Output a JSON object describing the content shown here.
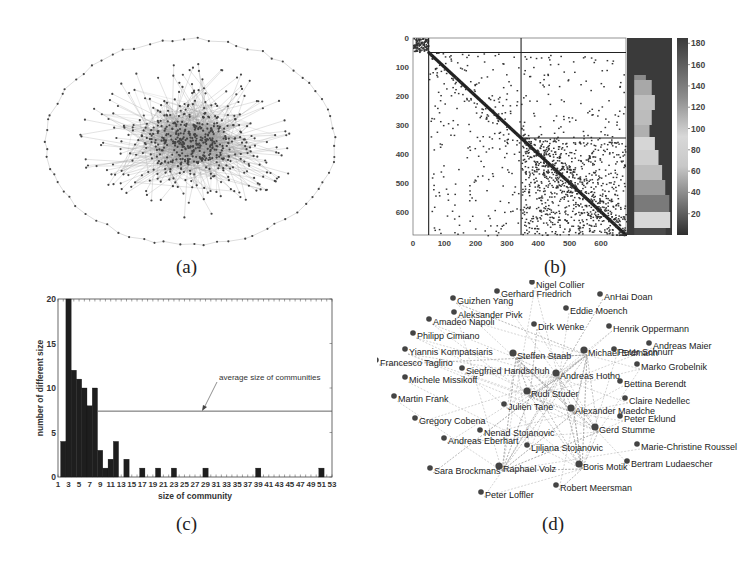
{
  "panels": {
    "a": {
      "caption": "(a)"
    },
    "b": {
      "caption": "(b)"
    },
    "c": {
      "caption": "(c)"
    },
    "d": {
      "caption": "(d)"
    }
  },
  "chart_data": [
    {
      "id": "a",
      "type": "network",
      "title": "",
      "description": "Large graph of a community network: dense central cluster with radiating edges, outer ring of isolated nodes arranged on an ellipse"
    },
    {
      "id": "b",
      "type": "heatmap",
      "title": "",
      "x_ticks": [
        "0",
        "100",
        "200",
        "300",
        "400",
        "500",
        "600"
      ],
      "y_ticks": [
        "0",
        "100",
        "200",
        "300",
        "400",
        "500",
        "600"
      ],
      "xlim": [
        0,
        680
      ],
      "ylim": [
        0,
        680
      ],
      "block_dividers": [
        50,
        345
      ],
      "colorbar": {
        "ticks": [
          "180",
          "160",
          "140",
          "120",
          "100",
          "80",
          "60",
          "40",
          "20"
        ],
        "range": [
          0,
          185
        ]
      },
      "description": "Adjacency matrix sorted by community with dense diagonal, divided into blocks at ~50 and ~345, side bar shows community membership"
    },
    {
      "id": "c",
      "type": "bar",
      "title": "",
      "xlabel": "size of community",
      "ylabel": "number of different size",
      "x_ticks": [
        "1",
        "3",
        "5",
        "7",
        "9",
        "11",
        "13",
        "15",
        "17",
        "19",
        "21",
        "23",
        "25",
        "27",
        "29",
        "31",
        "33",
        "35",
        "37",
        "39",
        "41",
        "43",
        "45",
        "47",
        "49",
        "51",
        "53"
      ],
      "y_ticks": [
        "0",
        "5",
        "10",
        "15",
        "20"
      ],
      "xlim": [
        1,
        53
      ],
      "ylim": [
        0,
        20
      ],
      "categories": [
        2,
        3,
        4,
        5,
        6,
        7,
        8,
        9,
        10,
        11,
        12,
        14,
        17,
        20,
        23,
        29,
        39,
        51
      ],
      "values": [
        4,
        20,
        12,
        11,
        10,
        8,
        10,
        3,
        1,
        2,
        4,
        2,
        1,
        1,
        1,
        1,
        1,
        1
      ],
      "reference_line": {
        "y": 7.4,
        "label": "average size of communities"
      },
      "annotation": "average size of communities"
    },
    {
      "id": "d",
      "type": "network",
      "title": "",
      "nodes": [
        {
          "label": "Nigel Collier",
          "x": 535,
          "y": 287
        },
        {
          "label": "Gerhard Friedrich",
          "x": 500,
          "y": 296
        },
        {
          "label": "AnHai Doan",
          "x": 603,
          "y": 299
        },
        {
          "label": "Guizhen Yang",
          "x": 456,
          "y": 303
        },
        {
          "label": "Eddie Moench",
          "x": 569,
          "y": 313
        },
        {
          "label": "Aleksander Pivk",
          "x": 457,
          "y": 317
        },
        {
          "label": "Amadeo Napoli",
          "x": 432,
          "y": 324
        },
        {
          "label": "Dirk Wenke",
          "x": 537,
          "y": 329
        },
        {
          "label": "Henrik Oppermann",
          "x": 612,
          "y": 331
        },
        {
          "label": "Philipp Cimiano",
          "x": 416,
          "y": 338
        },
        {
          "label": "Andreas Maier",
          "x": 652,
          "y": 348
        },
        {
          "label": "Yiannis Kompatsiaris",
          "x": 408,
          "y": 354
        },
        {
          "label": "Steffen Staab",
          "x": 516,
          "y": 358
        },
        {
          "label": "Michael Erdmann",
          "x": 587,
          "y": 355
        },
        {
          "label": "Peter Schnurr",
          "x": 617,
          "y": 354
        },
        {
          "label": "Francesco Taglino",
          "x": 379,
          "y": 365
        },
        {
          "label": "Marko Grobelnik",
          "x": 640,
          "y": 369
        },
        {
          "label": "Siegfried Handschuh",
          "x": 465,
          "y": 373
        },
        {
          "label": "Andreas Hotho",
          "x": 559,
          "y": 378
        },
        {
          "label": "Michele Missikoff",
          "x": 408,
          "y": 382
        },
        {
          "label": "Bettina Berendt",
          "x": 623,
          "y": 386
        },
        {
          "label": "Rudi Studer",
          "x": 530,
          "y": 396
        },
        {
          "label": "Martin Frank",
          "x": 397,
          "y": 401
        },
        {
          "label": "Claire Nedellec",
          "x": 628,
          "y": 403
        },
        {
          "label": "Julien Tane",
          "x": 507,
          "y": 409
        },
        {
          "label": "Alexander Maedche",
          "x": 574,
          "y": 413
        },
        {
          "label": "Peter Eklund",
          "x": 623,
          "y": 421
        },
        {
          "label": "Gregory Cobena",
          "x": 418,
          "y": 423
        },
        {
          "label": "Gerd Stumme",
          "x": 598,
          "y": 432
        },
        {
          "label": "Nenad Stojanovic",
          "x": 483,
          "y": 435
        },
        {
          "label": "Andreas Eberhart",
          "x": 447,
          "y": 443
        },
        {
          "label": "Ljiljana Stojanovic",
          "x": 530,
          "y": 450
        },
        {
          "label": "Marie-Christine Roussel",
          "x": 640,
          "y": 449
        },
        {
          "label": "Sara Brockmans",
          "x": 433,
          "y": 473
        },
        {
          "label": "Raphael Volz",
          "x": 502,
          "y": 471
        },
        {
          "label": "Boris Motik",
          "x": 582,
          "y": 469
        },
        {
          "label": "Bertram Ludaescher",
          "x": 630,
          "y": 466
        },
        {
          "label": "Robert Meersman",
          "x": 559,
          "y": 490
        },
        {
          "label": "Peter Loffler",
          "x": 484,
          "y": 497
        }
      ],
      "hubs": [
        "Steffen Staab",
        "Rudi Studer",
        "Alexander Maedche",
        "Raphael Volz",
        "Andreas Hotho",
        "Gerd Stumme",
        "Michael Erdmann",
        "Boris Motik"
      ]
    }
  ]
}
